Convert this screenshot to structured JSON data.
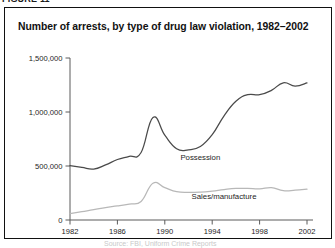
{
  "page": {
    "top_clipped_fragment": "FIGURE 11",
    "bottom_clipped_fragment": "Source: FBI, Uniform Crime Reports"
  },
  "figure": {
    "title": "Number of arrests, by type of drug law violation, 1982–2002",
    "border_color": "#111111",
    "background_color": "#ffffff"
  },
  "chart_data": {
    "type": "line",
    "title": "Number of arrests, by type of drug law violation, 1982–2002",
    "xlabel": "",
    "ylabel": "",
    "xlim": [
      1982,
      2002
    ],
    "ylim": [
      0,
      1500000
    ],
    "grid": false,
    "legend_position": "inline-labels",
    "x": [
      1982,
      1983,
      1984,
      1985,
      1986,
      1987,
      1988,
      1989,
      1990,
      1991,
      1992,
      1993,
      1994,
      1995,
      1996,
      1997,
      1998,
      1999,
      2000,
      2001,
      2002
    ],
    "xticks": [
      1982,
      1986,
      1990,
      1994,
      1998,
      2002
    ],
    "xtick_labels": [
      "1982",
      "1986",
      "1990",
      "1994",
      "1998",
      "2002"
    ],
    "yticks": [
      0,
      500000,
      1000000,
      1500000
    ],
    "ytick_labels": [
      "0",
      "500,000",
      "1,000,000",
      "1,500,000"
    ],
    "series": [
      {
        "name": "Possession",
        "label": "Possession",
        "color": "#4a4a4a",
        "line_width": 1.25,
        "label_x": 1993,
        "label_y": 560000,
        "values": [
          503000,
          487000,
          472000,
          510000,
          560000,
          590000,
          625000,
          950000,
          785000,
          660000,
          650000,
          680000,
          790000,
          965000,
          1100000,
          1160000,
          1160000,
          1200000,
          1270000,
          1240000,
          1270000
        ]
      },
      {
        "name": "Sales/manufacture",
        "label": "Sales/manufacture",
        "color": "#b8b8b8",
        "line_width": 1.25,
        "label_x": 1995,
        "label_y": 190000,
        "values": [
          60000,
          78000,
          95000,
          115000,
          130000,
          148000,
          172000,
          340000,
          300000,
          262000,
          255000,
          258000,
          268000,
          282000,
          292000,
          292000,
          288000,
          300000,
          272000,
          276000,
          285000
        ]
      }
    ]
  }
}
